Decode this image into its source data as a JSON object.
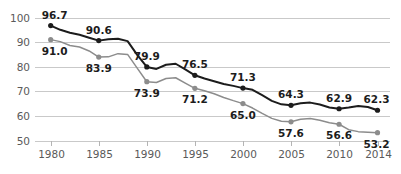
{
  "chart_data": {
    "type": "line",
    "title": "",
    "subtitle": "",
    "xlabel": "",
    "ylabel": "",
    "ylim": [
      50,
      100
    ],
    "yticks": [
      50,
      60,
      70,
      80,
      90,
      100
    ],
    "grid": true,
    "legend": "none",
    "categories": [
      "1980",
      "1985",
      "1990",
      "1995",
      "2000",
      "2005",
      "2010",
      "2014"
    ],
    "x": [
      1980,
      1985,
      1990,
      1995,
      2000,
      2005,
      2010,
      2014
    ],
    "series": [
      {
        "name": "upper",
        "color": "#1c1c1c",
        "label_position": "above",
        "values": [
          96.7,
          90.6,
          79.9,
          76.5,
          71.3,
          64.3,
          62.9,
          62.3
        ],
        "labels": [
          "96.7",
          "90.6",
          "79.9",
          "76.5",
          "71.3",
          "64.3",
          "62.9",
          "62.3"
        ],
        "yearly": [
          {
            "x": 1980,
            "y": 96.7
          },
          {
            "x": 1981,
            "y": 95.0
          },
          {
            "x": 1982,
            "y": 93.8
          },
          {
            "x": 1983,
            "y": 93.0
          },
          {
            "x": 1984,
            "y": 91.8
          },
          {
            "x": 1985,
            "y": 90.6
          },
          {
            "x": 1986,
            "y": 91.2
          },
          {
            "x": 1987,
            "y": 91.4
          },
          {
            "x": 1988,
            "y": 90.4
          },
          {
            "x": 1989,
            "y": 84.8
          },
          {
            "x": 1990,
            "y": 79.9
          },
          {
            "x": 1991,
            "y": 79.1
          },
          {
            "x": 1992,
            "y": 80.8
          },
          {
            "x": 1993,
            "y": 81.2
          },
          {
            "x": 1994,
            "y": 78.9
          },
          {
            "x": 1995,
            "y": 76.5
          },
          {
            "x": 1996,
            "y": 75.2
          },
          {
            "x": 1997,
            "y": 74.1
          },
          {
            "x": 1998,
            "y": 73.0
          },
          {
            "x": 1999,
            "y": 72.2
          },
          {
            "x": 2000,
            "y": 71.3
          },
          {
            "x": 2001,
            "y": 70.6
          },
          {
            "x": 2002,
            "y": 68.4
          },
          {
            "x": 2003,
            "y": 66.1
          },
          {
            "x": 2004,
            "y": 64.7
          },
          {
            "x": 2005,
            "y": 64.3
          },
          {
            "x": 2006,
            "y": 65.1
          },
          {
            "x": 2007,
            "y": 65.4
          },
          {
            "x": 2008,
            "y": 64.6
          },
          {
            "x": 2009,
            "y": 63.4
          },
          {
            "x": 2010,
            "y": 62.9
          },
          {
            "x": 2011,
            "y": 63.4
          },
          {
            "x": 2012,
            "y": 64.0
          },
          {
            "x": 2013,
            "y": 63.6
          },
          {
            "x": 2014,
            "y": 62.3
          }
        ]
      },
      {
        "name": "lower",
        "color": "#8c8c8c",
        "label_position": "below",
        "values": [
          91.0,
          83.9,
          73.9,
          71.2,
          65.0,
          57.6,
          56.6,
          53.2
        ],
        "labels": [
          "91.0",
          "83.9",
          "73.9",
          "71.2",
          "65.0",
          "57.6",
          "56.6",
          "53.2"
        ],
        "yearly": [
          {
            "x": 1980,
            "y": 91.0
          },
          {
            "x": 1981,
            "y": 90.2
          },
          {
            "x": 1982,
            "y": 88.6
          },
          {
            "x": 1983,
            "y": 88.0
          },
          {
            "x": 1984,
            "y": 86.4
          },
          {
            "x": 1985,
            "y": 83.9
          },
          {
            "x": 1986,
            "y": 84.0
          },
          {
            "x": 1987,
            "y": 85.3
          },
          {
            "x": 1988,
            "y": 85.0
          },
          {
            "x": 1989,
            "y": 79.4
          },
          {
            "x": 1990,
            "y": 73.9
          },
          {
            "x": 1991,
            "y": 73.6
          },
          {
            "x": 1992,
            "y": 75.2
          },
          {
            "x": 1993,
            "y": 75.5
          },
          {
            "x": 1994,
            "y": 73.3
          },
          {
            "x": 1995,
            "y": 71.2
          },
          {
            "x": 1996,
            "y": 70.2
          },
          {
            "x": 1997,
            "y": 69.0
          },
          {
            "x": 1998,
            "y": 67.5
          },
          {
            "x": 1999,
            "y": 66.2
          },
          {
            "x": 2000,
            "y": 65.0
          },
          {
            "x": 2001,
            "y": 63.2
          },
          {
            "x": 2002,
            "y": 61.0
          },
          {
            "x": 2003,
            "y": 59.0
          },
          {
            "x": 2004,
            "y": 57.8
          },
          {
            "x": 2005,
            "y": 57.6
          },
          {
            "x": 2006,
            "y": 58.6
          },
          {
            "x": 2007,
            "y": 58.9
          },
          {
            "x": 2008,
            "y": 58.2
          },
          {
            "x": 2009,
            "y": 57.2
          },
          {
            "x": 2010,
            "y": 56.6
          },
          {
            "x": 2011,
            "y": 54.4
          },
          {
            "x": 2012,
            "y": 53.6
          },
          {
            "x": 2013,
            "y": 53.4
          },
          {
            "x": 2014,
            "y": 53.2
          }
        ]
      }
    ]
  },
  "axis": {
    "y_tick_labels": [
      "100",
      "90",
      "80",
      "70",
      "60",
      "50"
    ],
    "x_tick_labels": [
      "1980",
      "1985",
      "1990",
      "1995",
      "2000",
      "2005",
      "2010",
      "2014"
    ]
  },
  "colors": {
    "upper_series": "#1c1c1c",
    "lower_series": "#8c8c8c",
    "gridline": "#c9c9c9",
    "axis_text": "#5a5a5a",
    "label_text": "#1c1c1c",
    "background": "#ffffff"
  }
}
